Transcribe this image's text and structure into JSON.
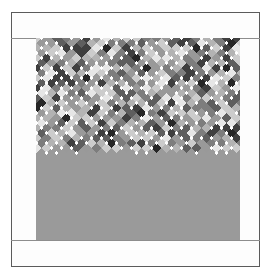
{
  "artwork": {
    "title": "",
    "kind": "quilt-argyle-diamond-pattern",
    "background_color": "#ffffff",
    "frame": {
      "border_color": "#5b5b5b",
      "fill_color": "#fdfdfd",
      "x": 11,
      "y": 12,
      "width": 249,
      "height": 255
    },
    "sashing_rules": [
      {
        "name": "top-sash-rule",
        "y": 38,
        "color": "#8d8d8d"
      },
      {
        "name": "bottom-sash-rule",
        "y": 240,
        "color": "#8d8d8d"
      }
    ],
    "field": {
      "x": 36,
      "y": 38,
      "width": 204,
      "height": 202,
      "base_color": "#9a9a9a",
      "cell_pitch": 10,
      "accent_dot_color": "#ffffff",
      "accent_dot_size": 4
    },
    "palette": [
      "#ffffff",
      "#e6e6e6",
      "#cccccc",
      "#b3b3b3",
      "#999999",
      "#7d7d7d",
      "#5e5e5e",
      "#3f3f3f",
      "#262626"
    ],
    "palette_names": [
      "white",
      "near-white",
      "light-grey",
      "light-medium-grey",
      "medium-grey",
      "medium-dark-grey",
      "dark-grey",
      "very-dark-grey",
      "near-black"
    ],
    "grid": {
      "columns": 21,
      "rows": 21,
      "seed": 20250417,
      "diagonal": true
    }
  }
}
